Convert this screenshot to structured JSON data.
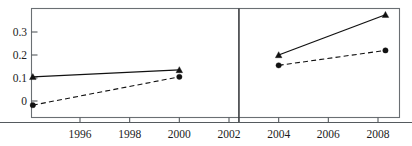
{
  "figure": {
    "title_fragment": "",
    "panel_count": 2,
    "background": "#ffffff",
    "frame_color": "#6a6f73",
    "divider_color": "#3a3d40",
    "ink_color": "#111111"
  },
  "chart_data": {
    "type": "line",
    "title": "",
    "subtitle": "",
    "xlabel": "",
    "ylabel": "",
    "xlim": [
      1994,
      2009.1
    ],
    "ylim": [
      -0.06,
      0.4
    ],
    "grid": false,
    "legend": null,
    "legend_position": "none",
    "panel_divider_x": 2002.4,
    "x_ticks": [
      1996,
      1998,
      2000,
      2002,
      2004,
      2006,
      2008
    ],
    "x_tick_labels": [
      "1996",
      "1998",
      "2000",
      "2002",
      "2004",
      "2006",
      "2008"
    ],
    "y_ticks": [
      0,
      0.1,
      0.2,
      0.3
    ],
    "y_tick_labels": [
      "0",
      "0.1",
      "0.2",
      "0.3"
    ],
    "series": [
      {
        "name": "solid-triangle-series",
        "marker": "triangle",
        "linestyle": "solid",
        "color": "#111111",
        "segments": [
          {
            "panel": "left",
            "x": [
              1994.1,
              2000.0
            ],
            "y": [
              0.105,
              0.135
            ]
          },
          {
            "panel": "right",
            "x": [
              2004.0,
              2008.3
            ],
            "y": [
              0.2,
              0.375
            ]
          }
        ]
      },
      {
        "name": "dashed-circle-series",
        "marker": "circle",
        "linestyle": "dashed",
        "color": "#111111",
        "segments": [
          {
            "panel": "left",
            "x": [
              1994.1,
              2000.0
            ],
            "y": [
              -0.018,
              0.105
            ]
          },
          {
            "panel": "right",
            "x": [
              2004.0,
              2008.3
            ],
            "y": [
              0.155,
              0.22
            ]
          }
        ]
      }
    ],
    "annotations": []
  }
}
